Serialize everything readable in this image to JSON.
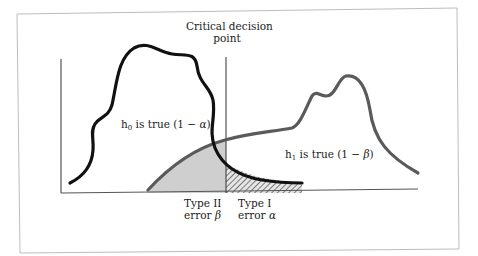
{
  "diagram": {
    "critical_label_line1": "Critical decision",
    "critical_label_line2": "point",
    "h0": {
      "prefix": "h",
      "subscript": "0",
      "text": " is true (1 − ",
      "symbol": "α",
      "suffix": ")"
    },
    "h1": {
      "prefix": "h",
      "subscript": "1",
      "text": " is true (1 − ",
      "symbol": "β",
      "suffix": ")"
    },
    "type2": {
      "line1": "Type II",
      "line2_prefix": "error ",
      "symbol": "β"
    },
    "type1": {
      "line1": "Type I",
      "line2_prefix": "error ",
      "symbol": "α"
    },
    "colors": {
      "frame": "#bdbdbd",
      "axis": "#555555",
      "h0_curve": "#111111",
      "h1_curve": "#5a5a5a",
      "type2_fill": "#cfcfcf",
      "type1_hatch": "#555555"
    }
  }
}
